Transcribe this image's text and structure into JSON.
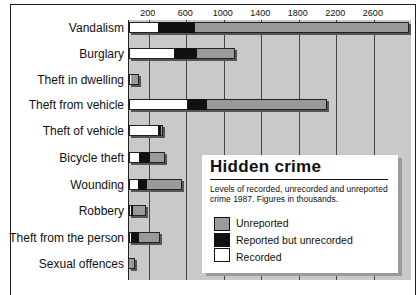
{
  "chart_data": {
    "type": "bar",
    "orientation": "horizontal",
    "stacked": true,
    "title": "Hidden crime",
    "subtitle": "Levels of recorded, unrecorded and unreported crime 1987. Figures in thousands.",
    "xlabel": "",
    "ylabel": "",
    "xlim": [
      0,
      3000
    ],
    "x_ticks": [
      200,
      600,
      1000,
      1400,
      1800,
      2200,
      2600
    ],
    "grid": true,
    "legend_position": "inside lower right",
    "categories": [
      "Vandalism",
      "Burglary",
      "Theft in dwelling",
      "Theft from vehicle",
      "Theft of vehicle",
      "Bicycle theft",
      "Wounding",
      "Robbery",
      "Theft from the person",
      "Sexual offences"
    ],
    "series": [
      {
        "name": "Recorded",
        "color": "#ffffff",
        "values": [
          310,
          480,
          20,
          620,
          310,
          110,
          100,
          20,
          20,
          0
        ]
      },
      {
        "name": "Reported but unrecorded",
        "color": "#111111",
        "values": [
          390,
          250,
          0,
          210,
          30,
          110,
          90,
          20,
          80,
          0
        ]
      },
      {
        "name": "Unreported",
        "color": "#9a9a9a",
        "values": [
          2290,
          400,
          80,
          1280,
          20,
          160,
          370,
          140,
          230,
          60
        ]
      }
    ]
  },
  "legend": {
    "title": "Hidden crime",
    "subtitle": "Levels of recorded, unrecorded and unreported crime 1987. Figures in thousands.",
    "items": [
      "Unreported",
      "Reported but unrecorded",
      "Recorded"
    ]
  },
  "ticks": [
    "200",
    "600",
    "1000",
    "1400",
    "1800",
    "2200",
    "2600"
  ]
}
